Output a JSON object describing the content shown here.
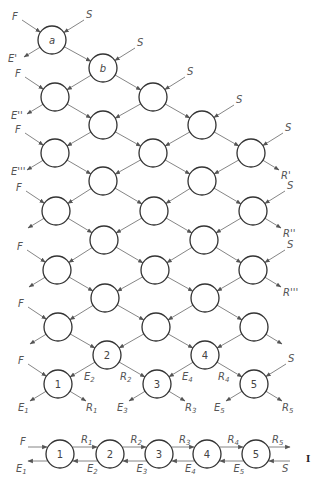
{
  "diagram": {
    "type": "countercurrent extraction cascade",
    "node_radius": 14,
    "feed_label": "F",
    "solvent_label": "S",
    "cascade_nodes": [
      {
        "id": "a",
        "label": "a",
        "x": 52,
        "y": 40
      },
      {
        "id": "b",
        "label": "b",
        "x": 103,
        "y": 68
      },
      {
        "id": "r3c0",
        "label": "",
        "x": 55,
        "y": 97
      },
      {
        "id": "r3c2",
        "label": "",
        "x": 153,
        "y": 97
      },
      {
        "id": "r4c1",
        "label": "",
        "x": 103,
        "y": 125
      },
      {
        "id": "r4c3",
        "label": "",
        "x": 202,
        "y": 125
      },
      {
        "id": "r5c0",
        "label": "",
        "x": 55,
        "y": 153
      },
      {
        "id": "r5c2",
        "label": "",
        "x": 153,
        "y": 153
      },
      {
        "id": "r5c4",
        "label": "",
        "x": 251,
        "y": 153
      },
      {
        "id": "r6c1",
        "label": "",
        "x": 103,
        "y": 181
      },
      {
        "id": "r6c3",
        "label": "",
        "x": 202,
        "y": 181
      },
      {
        "id": "r7c0",
        "label": "",
        "x": 56,
        "y": 211
      },
      {
        "id": "r7c2",
        "label": "",
        "x": 154,
        "y": 211
      },
      {
        "id": "r7c4",
        "label": "",
        "x": 253,
        "y": 211
      },
      {
        "id": "r8c1",
        "label": "",
        "x": 104,
        "y": 240
      },
      {
        "id": "r8c3",
        "label": "",
        "x": 204,
        "y": 240
      },
      {
        "id": "r9c0",
        "label": "",
        "x": 57,
        "y": 270
      },
      {
        "id": "r9c2",
        "label": "",
        "x": 155,
        "y": 270
      },
      {
        "id": "r9c4",
        "label": "",
        "x": 253,
        "y": 270
      },
      {
        "id": "r10c1",
        "label": "",
        "x": 105,
        "y": 298
      },
      {
        "id": "r10c3",
        "label": "",
        "x": 205,
        "y": 298
      },
      {
        "id": "r11c0",
        "label": "",
        "x": 58,
        "y": 327
      },
      {
        "id": "r11c2",
        "label": "",
        "x": 156,
        "y": 327
      },
      {
        "id": "r11c4",
        "label": "",
        "x": 254,
        "y": 327
      },
      {
        "id": "n2",
        "label": "2",
        "x": 107,
        "y": 355
      },
      {
        "id": "n4",
        "label": "4",
        "x": 205,
        "y": 355
      },
      {
        "id": "n1",
        "label": "1",
        "x": 58,
        "y": 384
      },
      {
        "id": "n3",
        "label": "3",
        "x": 157,
        "y": 384
      },
      {
        "id": "n5",
        "label": "5",
        "x": 254,
        "y": 384
      }
    ],
    "side_labels": {
      "extract_primes": [
        "E'",
        "E''",
        "E'''"
      ],
      "raffinate_primes": [
        "R'",
        "R''",
        "R'''"
      ]
    },
    "bottom_cascade_labels": {
      "E1": "E",
      "E2": "E",
      "E3": "E",
      "E4": "E",
      "E5": "E",
      "R1": "R",
      "R2": "R",
      "R3": "R",
      "R4": "R",
      "R5": "R",
      "subs": [
        "1",
        "2",
        "3",
        "4",
        "5"
      ]
    },
    "chain": {
      "nodes": [
        {
          "label": "1",
          "x": 60,
          "y": 454
        },
        {
          "label": "2",
          "x": 110,
          "y": 454
        },
        {
          "label": "3",
          "x": 159,
          "y": 454
        },
        {
          "label": "4",
          "x": 207,
          "y": 454
        },
        {
          "label": "5",
          "x": 256,
          "y": 454
        }
      ],
      "top_labels": [
        "R1",
        "R2",
        "R3",
        "R4",
        "R5"
      ],
      "bottom_labels": [
        "E1",
        "E2",
        "E3",
        "E4",
        "E5"
      ],
      "feed": "F",
      "solvent": "S"
    },
    "edge_fragment": "I"
  }
}
